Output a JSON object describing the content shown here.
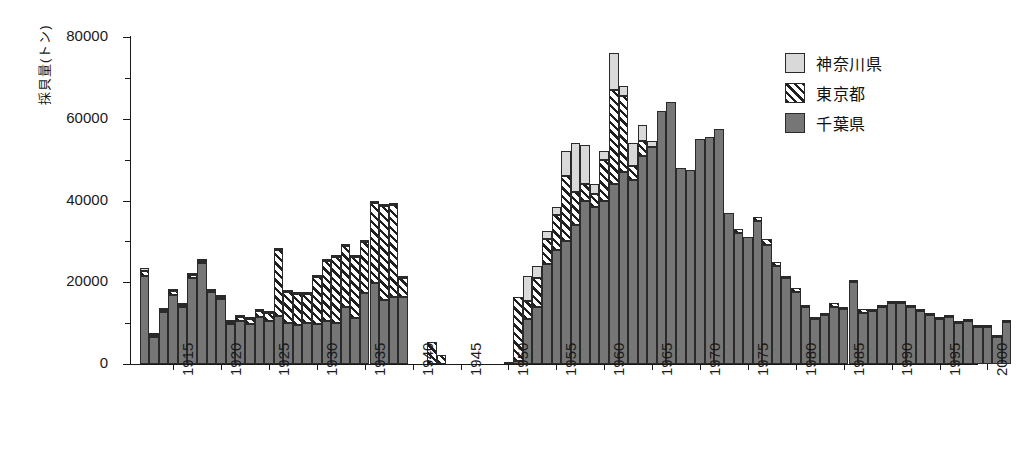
{
  "chart_data": {
    "type": "bar",
    "stacked": true,
    "title": "",
    "xlabel": "",
    "ylabel": "採貝量(トン)",
    "ylim": [
      0,
      80000
    ],
    "ytick_labels": [
      "0",
      "20000",
      "40000",
      "60000",
      "80000"
    ],
    "ytick_values": [
      0,
      20000,
      40000,
      60000,
      80000
    ],
    "yminor_values": [
      10000,
      30000,
      50000,
      70000
    ],
    "grid": false,
    "legend_position": "top-right",
    "xlim": [
      1911,
      2003
    ],
    "xtick_labels": [
      "1915",
      "1920",
      "1925",
      "1930",
      "1935",
      "1940",
      "1945",
      "1950",
      "1955",
      "1960",
      "1965",
      "1970",
      "1975",
      "1980",
      "1985",
      "1990",
      "1995",
      "2000"
    ],
    "xtick_values": [
      1915,
      1920,
      1925,
      1930,
      1935,
      1940,
      1945,
      1950,
      1955,
      1960,
      1965,
      1970,
      1975,
      1980,
      1985,
      1990,
      1995,
      2000
    ],
    "series": [
      {
        "name": "千葉県",
        "color": "#767676",
        "pattern": "solid-dark-gray",
        "values": [
          21500,
          6500,
          12700,
          17000,
          13900,
          21000,
          24800,
          17500,
          15800,
          9700,
          10500,
          9700,
          11500,
          10600,
          11800,
          10000,
          9600,
          10100,
          9700,
          10600,
          10100,
          13900,
          11200,
          17300,
          19800,
          15700,
          16300,
          16500,
          0,
          0,
          0,
          0,
          0,
          0,
          0,
          0,
          0,
          0,
          0,
          800,
          11000,
          14000,
          24500,
          28000,
          30000,
          34000,
          40000,
          38500,
          40000,
          44000,
          47000,
          45000,
          51000,
          53000,
          62000,
          64000,
          48000,
          47500,
          55000,
          55500,
          57500,
          37000,
          32000,
          31000,
          35000,
          29000,
          24000,
          21000,
          17500,
          14000,
          11000,
          12000,
          14000,
          13500,
          20000,
          12500,
          13000,
          14000,
          15000,
          15000,
          14000,
          13000,
          12000,
          11000,
          11500,
          10000,
          10500,
          9000,
          9000,
          6500,
          10300
        ]
      },
      {
        "name": "東京都",
        "color": "#1f1f1f",
        "pattern": "diagonal-hatch",
        "values": [
          1200,
          600,
          600,
          800,
          500,
          700,
          400,
          400,
          500,
          600,
          1000,
          1300,
          1500,
          1800,
          16000,
          7500,
          7500,
          7000,
          11500,
          14500,
          16000,
          15000,
          15000,
          12500,
          19500,
          23000,
          22500,
          4500,
          0,
          0,
          5500,
          2200,
          0,
          0,
          0,
          0,
          0,
          0,
          300,
          15500,
          4500,
          7000,
          6000,
          8500,
          16000,
          8000,
          4000,
          3000,
          10000,
          23000,
          18500,
          3500,
          3500,
          0,
          0,
          0,
          0,
          0,
          0,
          0,
          0,
          0,
          1000,
          0,
          1000,
          1500,
          1000,
          500,
          1000,
          500,
          500,
          500,
          1000,
          500,
          500,
          1000,
          500,
          500,
          500,
          500,
          500,
          400,
          400,
          400,
          400,
          400,
          300,
          300,
          300,
          300,
          500
        ]
      },
      {
        "name": "神奈川県",
        "color": "#d9d9d9",
        "pattern": "light-gray",
        "values": [
          900,
          400,
          400,
          500,
          300,
          400,
          300,
          300,
          300,
          300,
          300,
          300,
          300,
          300,
          300,
          300,
          300,
          300,
          300,
          300,
          300,
          300,
          300,
          300,
          300,
          300,
          300,
          300,
          0,
          0,
          0,
          0,
          0,
          0,
          0,
          0,
          0,
          0,
          0,
          0,
          6000,
          3000,
          2000,
          2000,
          6000,
          12000,
          9500,
          2500,
          2000,
          9000,
          2500,
          5500,
          4000,
          1500,
          0,
          0,
          0,
          0,
          0,
          0,
          0,
          0,
          0,
          0,
          0,
          0,
          0,
          0,
          0,
          0,
          0,
          0,
          0,
          0,
          0,
          0,
          0,
          0,
          0,
          0,
          0,
          0,
          0,
          0,
          0,
          0,
          0,
          0,
          0,
          0,
          0
        ]
      }
    ],
    "years": [
      1912,
      1913,
      1914,
      1915,
      1916,
      1917,
      1918,
      1919,
      1920,
      1921,
      1922,
      1923,
      1924,
      1925,
      1926,
      1927,
      1928,
      1929,
      1930,
      1931,
      1932,
      1933,
      1934,
      1935,
      1936,
      1937,
      1938,
      1939,
      1940,
      1941,
      1942,
      1943,
      1944,
      1945,
      1946,
      1947,
      1948,
      1949,
      1950,
      1951,
      1952,
      1953,
      1954,
      1955,
      1956,
      1957,
      1958,
      1959,
      1960,
      1961,
      1962,
      1963,
      1964,
      1965,
      1966,
      1967,
      1968,
      1969,
      1970,
      1971,
      1972,
      1973,
      1974,
      1975,
      1976,
      1977,
      1978,
      1979,
      1980,
      1981,
      1982,
      1983,
      1984,
      1985,
      1986,
      1987,
      1988,
      1989,
      1990,
      1991,
      1992,
      1993,
      1994,
      1995,
      1996,
      1997,
      1998,
      1999,
      2000,
      2001,
      2002
    ]
  },
  "legend": {
    "entries": [
      {
        "label": "神奈川県",
        "key": "kanagawa"
      },
      {
        "label": "東京都",
        "key": "tokyo"
      },
      {
        "label": "千葉県",
        "key": "chiba"
      }
    ]
  }
}
